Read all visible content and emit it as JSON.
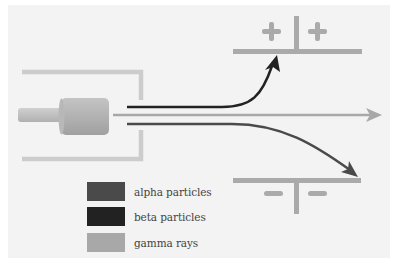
{
  "diagram": {
    "positive_plate": {
      "signs": [
        "+",
        "+"
      ],
      "color": "#aaaaaa"
    },
    "negative_plate": {
      "signs": [
        "−",
        "−"
      ],
      "color": "#aaaaaa"
    },
    "source": {
      "label": "radioactive source in lead box",
      "color": "#b0b0b0"
    }
  },
  "legend": {
    "items": [
      {
        "label": "alpha particles",
        "color": "#4a4a4a"
      },
      {
        "label": "beta particles",
        "color": "#222222"
      },
      {
        "label": "gamma rays",
        "color": "#a8a8a8"
      }
    ]
  },
  "colors": {
    "background": "#f3f3f3",
    "box": "#cccccc",
    "alpha": "#4a4a4a",
    "beta": "#222222",
    "gamma": "#a8a8a8"
  }
}
